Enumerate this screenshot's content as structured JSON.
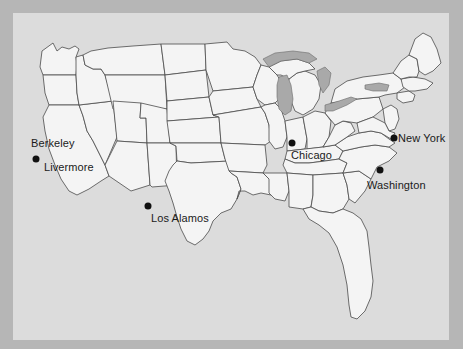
{
  "image": {
    "kind": "map",
    "region": "United States",
    "width": 463,
    "height": 349,
    "background_color": "#b6b6b6",
    "panel_color": "#dcdcdc",
    "land_color": "#f4f4f4",
    "border_color": "#4a4a4a",
    "lake_color": "#a9a9a9",
    "marker_color": "#111111",
    "label_color": "#1a1a1a"
  },
  "cities": [
    {
      "name": "Berkeley",
      "label": "Berkeley",
      "marker_x": 33,
      "marker_y": 157,
      "label_x": 31,
      "label_y": 137,
      "has_marker": false
    },
    {
      "name": "Livermore",
      "label": "Livermore",
      "marker_x": 36,
      "marker_y": 159,
      "label_x": 44,
      "label_y": 161,
      "has_marker": true
    },
    {
      "name": "Los Alamos",
      "label": "Los Alamos",
      "marker_x": 148,
      "marker_y": 206,
      "label_x": 151,
      "label_y": 212,
      "has_marker": true
    },
    {
      "name": "Chicago",
      "label": "Chicago",
      "marker_x": 292,
      "marker_y": 143,
      "label_x": 291,
      "label_y": 149,
      "has_marker": true
    },
    {
      "name": "Washington",
      "label": "Washington",
      "marker_x": 380,
      "marker_y": 170,
      "label_x": 367,
      "label_y": 179,
      "has_marker": true
    },
    {
      "name": "New York",
      "label": "New York",
      "marker_x": 394,
      "marker_y": 138,
      "label_x": 398,
      "label_y": 132,
      "has_marker": true
    }
  ],
  "lakes": [
    {
      "name": "Lake Michigan"
    },
    {
      "name": "Lake Superior"
    },
    {
      "name": "Lake Huron"
    },
    {
      "name": "Lake Erie"
    },
    {
      "name": "Lake Ontario"
    }
  ]
}
